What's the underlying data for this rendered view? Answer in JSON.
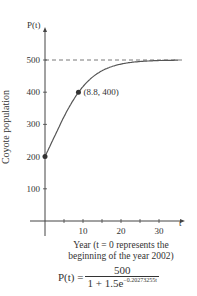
{
  "chart_data": {
    "type": "line",
    "title": "",
    "xlabel": "Year (t = 0 represents the beginning of the year 2002)",
    "ylabel": "Coyote population",
    "y_axis_symbol": "P(t)",
    "x_axis_symbol": "t",
    "xlim": [
      0,
      35
    ],
    "ylim": [
      0,
      550
    ],
    "x_ticks": [
      5,
      10,
      15,
      20,
      25,
      30
    ],
    "x_tick_labels": [
      "10",
      "20",
      "30"
    ],
    "y_ticks": [
      100,
      200,
      300,
      400,
      500
    ],
    "y_tick_labels": [
      "100",
      "200",
      "300",
      "400",
      "500"
    ],
    "asymptote": 500,
    "series": [
      {
        "name": "P(t)",
        "formula": "500/(1+1.5e^(-0.20273255t))"
      }
    ],
    "points": [
      {
        "x": 0,
        "y": 200
      },
      {
        "x": 8.8,
        "y": 400,
        "label": "(8.8, 400)"
      }
    ],
    "equation": {
      "lhs": "P(t) =",
      "numerator": "500",
      "denominator": "1 + 1.5e",
      "exponent": "−0.20273255t"
    },
    "grid": false
  }
}
